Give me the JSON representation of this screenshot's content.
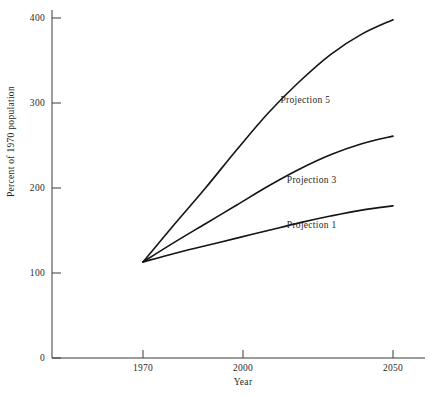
{
  "chart_data": {
    "type": "line",
    "title": "",
    "xlabel": "Year",
    "ylabel": "Percent of 1970 population",
    "xlim": [
      1966,
      2055
    ],
    "ylim": [
      0,
      420
    ],
    "xticks": [
      1970,
      2000,
      2050
    ],
    "xtick_labels": [
      "1970",
      "2000",
      "2050"
    ],
    "yticks": [
      0,
      100,
      200,
      300,
      400
    ],
    "ytick_labels": [
      "0",
      "100",
      "200",
      "300",
      "400"
    ],
    "grid": false,
    "legend": "inline-labels",
    "x": [
      1970,
      1980,
      1990,
      2000,
      2010,
      2020,
      2030,
      2040,
      2050
    ],
    "series": [
      {
        "name": "Projection 5",
        "label": "Projection 5",
        "values": [
          113,
          157,
          200,
          245,
          288,
          325,
          357,
          381,
          398
        ],
        "color": "#141414"
      },
      {
        "name": "Projection 3",
        "label": "Projection 3",
        "values": [
          113,
          136,
          158,
          180,
          202,
          222,
          239,
          252,
          261
        ],
        "color": "#141414"
      },
      {
        "name": "Projection 1",
        "label": "Projection 1",
        "values": [
          113,
          123,
          132,
          141,
          150,
          159,
          167,
          174,
          179
        ],
        "color": "#141414"
      }
    ],
    "annotations": [
      {
        "text": "Projection 5",
        "x": 2014,
        "y": 302
      },
      {
        "text": "Projection 3",
        "x": 2016,
        "y": 208
      },
      {
        "text": "Projection 1",
        "x": 2016,
        "y": 155
      }
    ]
  }
}
